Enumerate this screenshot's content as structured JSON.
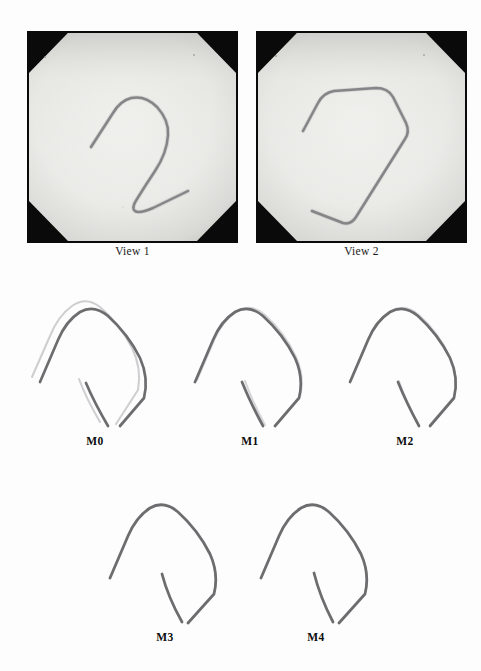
{
  "figure": {
    "background_color": "#fdfdfd",
    "photo_row": {
      "items": [
        {
          "caption": "View 1",
          "frame_color": "#0a0a0a",
          "plate_color": "#e8e8e6",
          "wire_color": "#6e6e70"
        },
        {
          "caption": "View 2",
          "frame_color": "#0a0a0a",
          "plate_color": "#e8e8e6",
          "wire_color": "#6e6e70"
        }
      ]
    },
    "model_rows": [
      {
        "items": [
          {
            "caption": "M0",
            "primary_color": "#6d6d70",
            "ghost_color": "#cfcfd2",
            "has_ghost": true
          },
          {
            "caption": "M1",
            "primary_color": "#6d6d70",
            "ghost_color": "#d6d6d9",
            "has_ghost": true
          },
          {
            "caption": "M2",
            "primary_color": "#6d6d70",
            "ghost_color": "#dadade",
            "has_ghost": true
          }
        ]
      },
      {
        "items": [
          {
            "caption": "M3",
            "primary_color": "#6d6d70",
            "ghost_color": "#e2e2e5",
            "has_ghost": false
          },
          {
            "caption": "M4",
            "primary_color": "#6d6d70",
            "ghost_color": "#e2e2e5",
            "has_ghost": false
          }
        ]
      }
    ]
  }
}
